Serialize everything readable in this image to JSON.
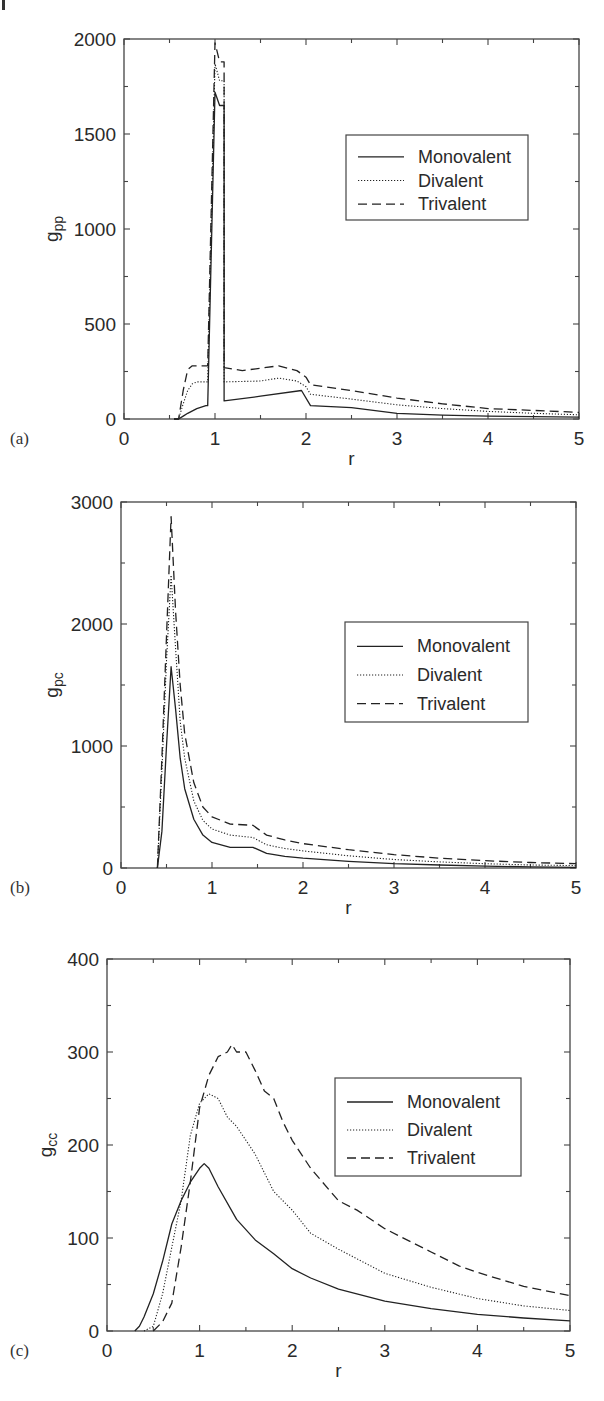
{
  "chart_data": [
    {
      "type": "line",
      "panel_label": "(a)",
      "title": "",
      "xlabel": "r",
      "ylabel": "g",
      "ylabel_sub": "pp",
      "xlim": [
        0,
        5
      ],
      "ylim": [
        0,
        2000
      ],
      "xticks": [
        "0",
        "1",
        "2",
        "3",
        "4",
        "5"
      ],
      "yticks": [
        "0",
        "500",
        "1000",
        "1500",
        "2000"
      ],
      "grid": false,
      "legend_position": "upper right",
      "legend": [
        "Monovalent",
        "Divalent",
        "Trivalent"
      ],
      "series": [
        {
          "name": "Monovalent",
          "style": "solid",
          "x": [
            0.55,
            0.6,
            0.65,
            0.7,
            0.8,
            0.9,
            0.92,
            1.0,
            1.05,
            1.1,
            1.1,
            1.5,
            1.95,
            2.05,
            2.5,
            3.0,
            3.5,
            4.0,
            4.5,
            5.0
          ],
          "y": [
            0,
            0,
            15,
            30,
            55,
            70,
            70,
            1720,
            1650,
            1650,
            95,
            120,
            150,
            70,
            60,
            30,
            20,
            15,
            12,
            10
          ]
        },
        {
          "name": "Divalent",
          "style": "dotted",
          "x": [
            0.55,
            0.6,
            0.65,
            0.7,
            0.75,
            0.8,
            0.92,
            1.0,
            1.05,
            1.1,
            1.1,
            1.5,
            1.7,
            1.9,
            2.0,
            2.05,
            2.5,
            3.0,
            3.5,
            4.0,
            4.5,
            5.0
          ],
          "y": [
            0,
            0,
            80,
            150,
            185,
            195,
            195,
            1870,
            1780,
            1780,
            195,
            200,
            215,
            200,
            170,
            130,
            105,
            75,
            55,
            40,
            30,
            22
          ]
        },
        {
          "name": "Trivalent",
          "style": "dashed",
          "x": [
            0.55,
            0.6,
            0.65,
            0.7,
            0.75,
            0.8,
            0.92,
            1.0,
            1.05,
            1.1,
            1.1,
            1.3,
            1.7,
            1.9,
            2.0,
            2.05,
            2.5,
            3.0,
            3.5,
            4.0,
            4.5,
            5.0
          ],
          "y": [
            0,
            0,
            150,
            260,
            280,
            280,
            280,
            1980,
            1880,
            1880,
            270,
            255,
            280,
            255,
            220,
            180,
            150,
            110,
            80,
            55,
            45,
            35
          ]
        }
      ]
    },
    {
      "type": "line",
      "panel_label": "(b)",
      "title": "",
      "xlabel": "r",
      "ylabel": "g",
      "ylabel_sub": "pc",
      "xlim": [
        0,
        5
      ],
      "ylim": [
        0,
        3000
      ],
      "xticks": [
        "0",
        "1",
        "2",
        "3",
        "4",
        "5"
      ],
      "yticks": [
        "0",
        "1000",
        "2000",
        "3000"
      ],
      "grid": false,
      "legend_position": "center right",
      "legend": [
        "Monovalent",
        "Divalent",
        "Trivalent"
      ],
      "series": [
        {
          "name": "Monovalent",
          "style": "solid",
          "x": [
            0.4,
            0.45,
            0.5,
            0.55,
            0.6,
            0.65,
            0.7,
            0.8,
            0.9,
            1.0,
            1.2,
            1.45,
            1.6,
            1.8,
            2.0,
            2.5,
            3.0,
            3.5,
            4.0,
            4.5,
            5.0
          ],
          "y": [
            0,
            300,
            1000,
            1650,
            1300,
            900,
            650,
            400,
            270,
            210,
            170,
            170,
            120,
            95,
            80,
            55,
            35,
            25,
            15,
            10,
            5
          ]
        },
        {
          "name": "Divalent",
          "style": "dotted",
          "x": [
            0.4,
            0.45,
            0.5,
            0.55,
            0.6,
            0.65,
            0.7,
            0.8,
            0.9,
            1.0,
            1.2,
            1.45,
            1.6,
            1.8,
            2.0,
            2.5,
            3.0,
            3.5,
            4.0,
            4.5,
            5.0
          ],
          "y": [
            0,
            800,
            1700,
            2400,
            1800,
            1200,
            900,
            550,
            390,
            320,
            270,
            250,
            190,
            160,
            140,
            100,
            70,
            50,
            35,
            25,
            20
          ]
        },
        {
          "name": "Trivalent",
          "style": "dashed",
          "x": [
            0.4,
            0.45,
            0.5,
            0.55,
            0.6,
            0.65,
            0.7,
            0.8,
            0.9,
            1.0,
            1.2,
            1.45,
            1.6,
            1.8,
            2.0,
            2.5,
            3.0,
            3.5,
            4.0,
            4.5,
            5.0
          ],
          "y": [
            0,
            900,
            1900,
            2880,
            2100,
            1500,
            1100,
            700,
            500,
            420,
            360,
            350,
            270,
            230,
            200,
            150,
            110,
            80,
            60,
            45,
            35
          ]
        }
      ]
    },
    {
      "type": "line",
      "panel_label": "(c)",
      "title": "",
      "xlabel": "r",
      "ylabel": "g",
      "ylabel_sub": "cc",
      "xlim": [
        0,
        5
      ],
      "ylim": [
        0,
        400
      ],
      "xticks": [
        "0",
        "1",
        "2",
        "3",
        "4",
        "5"
      ],
      "yticks": [
        "0",
        "100",
        "200",
        "300",
        "400"
      ],
      "grid": false,
      "legend_position": "upper right",
      "legend": [
        "Monovalent",
        "Divalent",
        "Trivalent"
      ],
      "series": [
        {
          "name": "Monovalent",
          "style": "solid",
          "x": [
            0.3,
            0.35,
            0.4,
            0.5,
            0.6,
            0.7,
            0.8,
            0.9,
            1.0,
            1.05,
            1.1,
            1.2,
            1.4,
            1.6,
            1.8,
            2.0,
            2.2,
            2.5,
            3.0,
            3.5,
            4.0,
            4.5,
            5.0
          ],
          "y": [
            0,
            5,
            15,
            40,
            75,
            115,
            140,
            160,
            175,
            180,
            175,
            155,
            120,
            98,
            83,
            67,
            57,
            45,
            32,
            24,
            18,
            14,
            11
          ]
        },
        {
          "name": "Divalent",
          "style": "dotted",
          "x": [
            0.4,
            0.5,
            0.6,
            0.7,
            0.8,
            0.9,
            1.0,
            1.1,
            1.2,
            1.3,
            1.4,
            1.5,
            1.6,
            1.8,
            2.0,
            2.2,
            2.5,
            3.0,
            3.5,
            4.0,
            4.5,
            5.0
          ],
          "y": [
            0,
            5,
            40,
            90,
            140,
            210,
            245,
            255,
            250,
            230,
            220,
            205,
            190,
            150,
            130,
            105,
            88,
            62,
            47,
            35,
            27,
            22
          ]
        },
        {
          "name": "Trivalent",
          "style": "dashed",
          "x": [
            0.5,
            0.6,
            0.7,
            0.8,
            0.9,
            1.0,
            1.1,
            1.2,
            1.3,
            1.35,
            1.4,
            1.5,
            1.6,
            1.7,
            1.8,
            1.9,
            2.0,
            2.2,
            2.5,
            2.7,
            3.0,
            3.3,
            3.5,
            3.8,
            4.0,
            4.5,
            5.0
          ],
          "y": [
            0,
            10,
            30,
            90,
            160,
            240,
            275,
            295,
            300,
            308,
            300,
            300,
            280,
            258,
            250,
            225,
            205,
            175,
            140,
            130,
            110,
            95,
            85,
            70,
            63,
            48,
            38
          ]
        }
      ]
    }
  ],
  "panels": [
    {
      "label": "(a)",
      "ylabel": "g",
      "ylabel_sub": "pp",
      "xlabel": "r",
      "xticks": [
        "0",
        "1",
        "2",
        "3",
        "4",
        "5"
      ],
      "yticks": [
        "0",
        "500",
        "1000",
        "1500",
        "2000"
      ],
      "legend": [
        "Monovalent",
        "Divalent",
        "Trivalent"
      ]
    },
    {
      "label": "(b)",
      "ylabel": "g",
      "ylabel_sub": "pc",
      "xlabel": "r",
      "xticks": [
        "0",
        "1",
        "2",
        "3",
        "4",
        "5"
      ],
      "yticks": [
        "0",
        "1000",
        "2000",
        "3000"
      ],
      "legend": [
        "Monovalent",
        "Divalent",
        "Trivalent"
      ]
    },
    {
      "label": "(c)",
      "ylabel": "g",
      "ylabel_sub": "cc",
      "xlabel": "r",
      "xticks": [
        "0",
        "1",
        "2",
        "3",
        "4",
        "5"
      ],
      "yticks": [
        "0",
        "100",
        "200",
        "300",
        "400"
      ],
      "legend": [
        "Monovalent",
        "Divalent",
        "Trivalent"
      ]
    }
  ],
  "colors": {
    "line": "#222222",
    "frame": "#444444",
    "background": "#ffffff"
  }
}
